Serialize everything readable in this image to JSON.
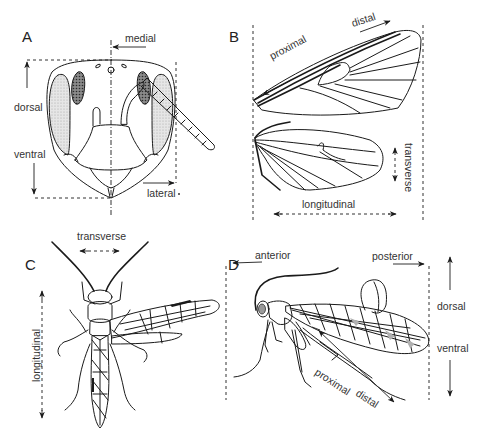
{
  "figure": {
    "type": "anatomical-orientation-diagram",
    "panels": [
      {
        "id": "A",
        "letter": "A",
        "subject": "insect head, frontal view",
        "labels": {
          "medial": "medial",
          "dorsal": "dorsal",
          "ventral": "ventral",
          "lateral": "lateral"
        }
      },
      {
        "id": "B",
        "letter": "B",
        "subject": "insect fore- and hindwing",
        "labels": {
          "proximal": "proximal",
          "distal": "distal",
          "transverse": "transverse",
          "longitudinal": "longitudinal"
        }
      },
      {
        "id": "C",
        "letter": "C",
        "subject": "wasp, dorsal view",
        "labels": {
          "transverse": "transverse",
          "longitudinal": "longitudinal"
        }
      },
      {
        "id": "D",
        "letter": "D",
        "subject": "snakefly/neuropteran, lateral view",
        "labels": {
          "anterior": "anterior",
          "posterior": "posterior",
          "dorsal": "dorsal",
          "ventral": "ventral",
          "proximal": "proximal",
          "distal": "distal"
        }
      }
    ],
    "colors": {
      "line": "#1a1a1a",
      "text": "#333333",
      "background": "#ffffff",
      "stipple": "#d8d8d8"
    }
  }
}
